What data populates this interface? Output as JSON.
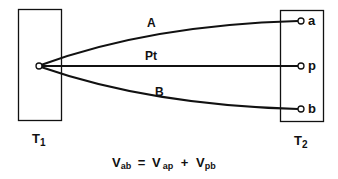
{
  "diagram": {
    "type": "thermocouple-circuit",
    "blocks": [
      {
        "id": "T1",
        "label": "T",
        "subscript": "1"
      },
      {
        "id": "T2",
        "label": "T",
        "subscript": "2"
      }
    ],
    "wires": [
      {
        "id": "A",
        "label": "A",
        "to_terminal": "a"
      },
      {
        "id": "Pt",
        "label": "Pt",
        "to_terminal": "p"
      },
      {
        "id": "B",
        "label": "B",
        "to_terminal": "b"
      }
    ],
    "terminals": [
      "a",
      "p",
      "b"
    ],
    "equation": {
      "lhs": {
        "symbol": "V",
        "sub": "ab"
      },
      "eq": "=",
      "term1": {
        "symbol": "V",
        "sub": "ap"
      },
      "plus": "+",
      "term2": {
        "symbol": "V",
        "sub": "pb"
      }
    },
    "colors": {
      "line": "#111111",
      "background": "#ffffff"
    }
  }
}
